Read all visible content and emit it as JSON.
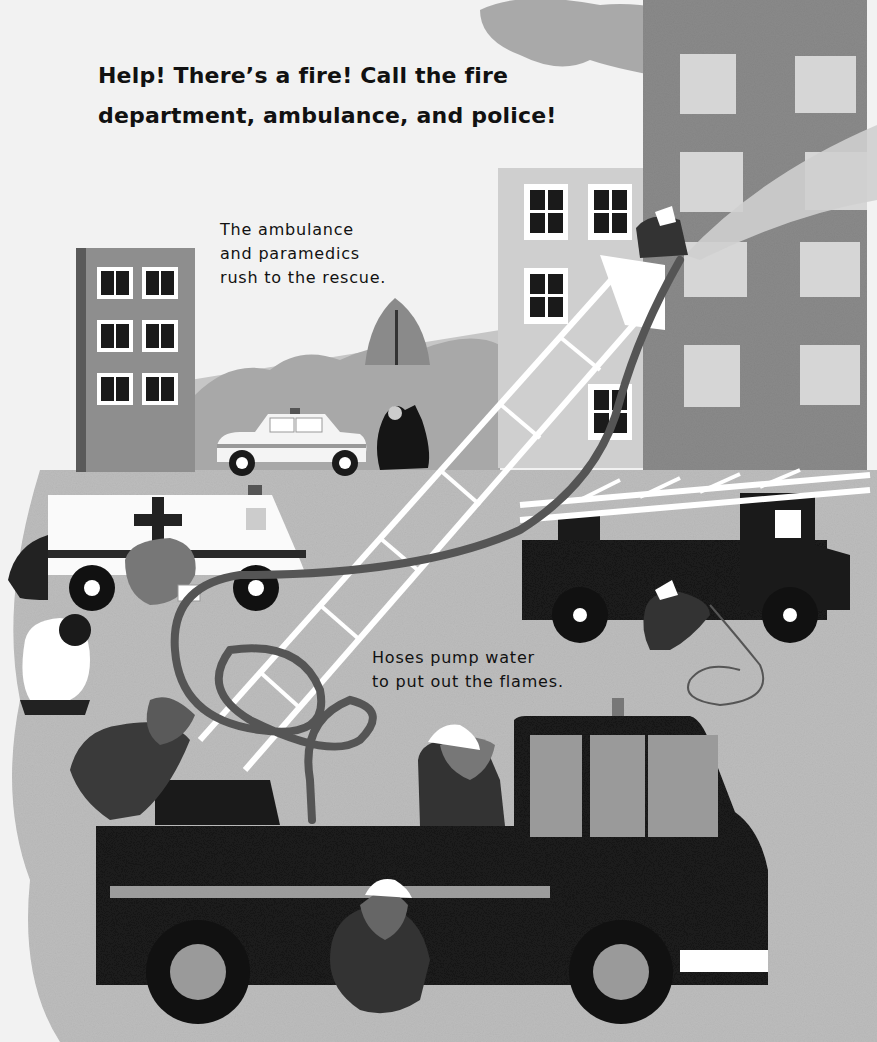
{
  "page": {
    "headline_lines": [
      "Help! There’s a fire! Call the fire",
      "department, ambulance, and police!"
    ],
    "captions": [
      {
        "id": "ambulance-caption",
        "lines": [
          "The ambulance",
          "and paramedics",
          "rush to the rescue."
        ]
      },
      {
        "id": "hoses-caption",
        "lines": [
          "Hoses pump water",
          "to put out the flames."
        ]
      }
    ]
  },
  "illustration": {
    "style": "grayscale collage",
    "elements": [
      "burning-apartment-building",
      "smoke-cloud",
      "water-spray",
      "background-building-left",
      "background-building-middle",
      "trees",
      "police-car",
      "bear-waving",
      "ambulance",
      "paramedic-bears",
      "ladder-truck",
      "aerial-ladder",
      "fire-hose",
      "firefighter-bears",
      "fire-engine"
    ]
  },
  "colors": {
    "sky": "#f2f2f2",
    "ground": "#bdbdbd",
    "building_dark": "#8a8a8a",
    "building_mid": "#9a9a9a",
    "building_light": "#d2d2d2",
    "window_light": "#d6d6d6",
    "window_dark": "#1a1a1a",
    "truck": "#1e1e1e",
    "hose": "#555555",
    "white": "#ffffff",
    "text": "#111111"
  }
}
